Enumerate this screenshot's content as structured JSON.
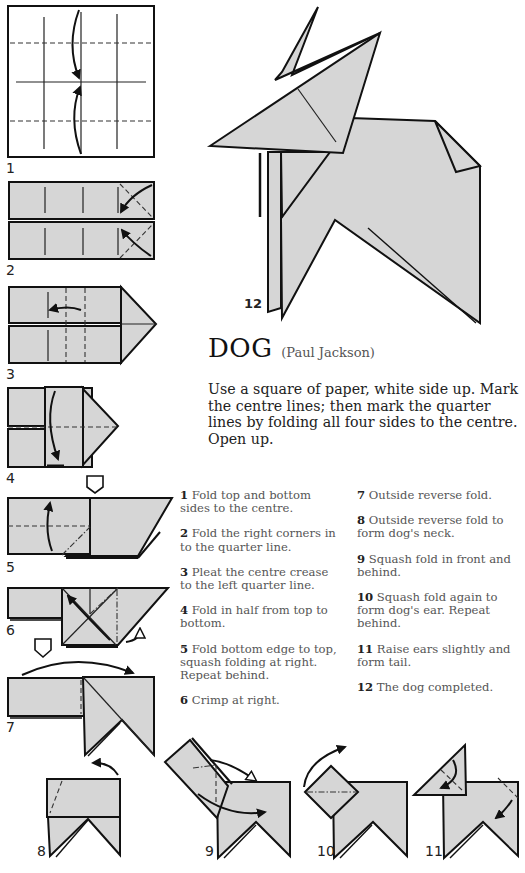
{
  "title": {
    "main": "DOG",
    "author": "(Paul Jackson)"
  },
  "intro": "Use a square of paper, white side up. Mark the centre lines; then mark the quarter lines by folding all four sides to the centre. Open up.",
  "steps_left": [
    {
      "num": "1",
      "text": " Fold top and bottom sides to the centre."
    },
    {
      "num": "2",
      "text": " Fold the right corners in to the quarter line."
    },
    {
      "num": "3",
      "text": " Pleat the centre crease to the left quarter line."
    },
    {
      "num": "4",
      "text": " Fold in half from top to bottom."
    },
    {
      "num": "5",
      "text": " Fold bottom edge to top, squash folding at right. Repeat behind."
    },
    {
      "num": "6",
      "text": " Crimp at right."
    }
  ],
  "steps_right": [
    {
      "num": "7",
      "text": " Outside reverse fold."
    },
    {
      "num": "8",
      "text": " Outside reverse fold to form dog's neck."
    },
    {
      "num": "9",
      "text": " Squash fold in front and behind."
    },
    {
      "num": "10",
      "text": " Squash fold again to form dog's ear. Repeat behind."
    },
    {
      "num": "11",
      "text": " Raise ears slightly and form tail."
    },
    {
      "num": "12",
      "text": " The dog completed."
    }
  ],
  "diagram_labels": [
    "1",
    "2",
    "3",
    "4",
    "5",
    "6",
    "7",
    "8",
    "9",
    "10",
    "11",
    "12"
  ],
  "colors": {
    "paper_fill": "#d6d6d6",
    "stroke": "#111111",
    "background": "#ffffff"
  }
}
